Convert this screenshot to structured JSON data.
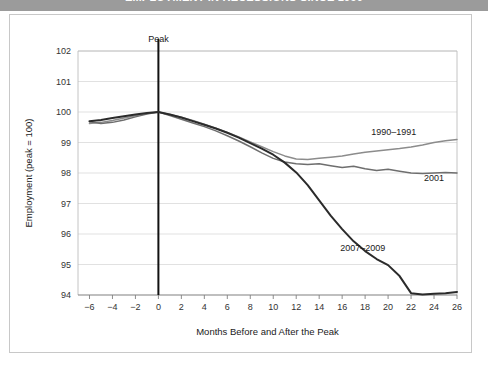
{
  "title": "EMPLOYMENT IN RECESSIONS SINCE 1990",
  "chart_data": {
    "type": "line",
    "title": "EMPLOYMENT IN RECESSIONS SINCE 1990",
    "xlabel": "Months Before and After the Peak",
    "ylabel": "Employment (peak = 100)",
    "xlim": [
      -7,
      26
    ],
    "ylim": [
      94,
      102
    ],
    "xticks": [
      -6,
      -4,
      -2,
      0,
      2,
      4,
      6,
      8,
      10,
      12,
      14,
      16,
      18,
      20,
      22,
      24,
      26
    ],
    "xtick_labels": [
      "−6",
      "−4",
      "−2",
      "0",
      "2",
      "4",
      "6",
      "8",
      "10",
      "12",
      "14",
      "16",
      "18",
      "20",
      "22",
      "24",
      "26"
    ],
    "yticks": [
      94,
      95,
      96,
      97,
      98,
      99,
      100,
      101,
      102
    ],
    "ytick_labels": [
      "94",
      "95",
      "96",
      "97",
      "98",
      "99",
      "100",
      "101",
      "102"
    ],
    "grid": "horizontal",
    "legend": "inline-annotations",
    "annotations": [
      {
        "text": "Peak",
        "x": 0,
        "y": 102.3,
        "kind": "vertical-line-label"
      },
      {
        "text": "1990–1991",
        "x": 20.5,
        "y": 99.25,
        "kind": "series-label"
      },
      {
        "text": "2001",
        "x": 24.0,
        "y": 97.75,
        "kind": "series-label"
      },
      {
        "text": "2007–2009",
        "x": 17.8,
        "y": 95.45,
        "kind": "series-label"
      }
    ],
    "series": [
      {
        "name": "1990–1991",
        "color": "#8c8c8c",
        "x": [
          -6,
          -5,
          -4,
          -3,
          -2,
          -1,
          0,
          1,
          2,
          3,
          4,
          5,
          6,
          7,
          8,
          9,
          10,
          11,
          12,
          13,
          14,
          15,
          16,
          17,
          18,
          19,
          20,
          21,
          22,
          23,
          24,
          25,
          26
        ],
        "values": [
          99.62,
          99.66,
          99.72,
          99.8,
          99.88,
          99.95,
          100.0,
          99.92,
          99.83,
          99.72,
          99.6,
          99.47,
          99.33,
          99.18,
          99.02,
          98.86,
          98.7,
          98.56,
          98.46,
          98.44,
          98.48,
          98.52,
          98.56,
          98.62,
          98.68,
          98.72,
          98.76,
          98.8,
          98.85,
          98.92,
          99.0,
          99.06,
          99.1
        ]
      },
      {
        "name": "2001",
        "color": "#6e6e6e",
        "x": [
          -6,
          -5,
          -4,
          -3,
          -2,
          -1,
          0,
          1,
          2,
          3,
          4,
          5,
          6,
          7,
          8,
          9,
          10,
          11,
          12,
          13,
          14,
          15,
          16,
          17,
          18,
          19,
          20,
          21,
          22,
          23,
          24,
          25,
          26
        ],
        "values": [
          99.68,
          99.62,
          99.66,
          99.74,
          99.84,
          99.93,
          100.0,
          99.88,
          99.76,
          99.64,
          99.52,
          99.38,
          99.22,
          99.05,
          98.86,
          98.66,
          98.48,
          98.36,
          98.3,
          98.28,
          98.3,
          98.24,
          98.18,
          98.22,
          98.14,
          98.08,
          98.12,
          98.06,
          98.0,
          97.98,
          98.0,
          98.02,
          98.0
        ]
      },
      {
        "name": "2007–2009",
        "color": "#2b2b2b",
        "x": [
          -6,
          -5,
          -4,
          -3,
          -2,
          -1,
          0,
          1,
          2,
          3,
          4,
          5,
          6,
          7,
          8,
          9,
          10,
          11,
          12,
          13,
          14,
          15,
          16,
          17,
          18,
          19,
          20,
          21,
          22,
          23,
          24,
          25,
          26
        ],
        "values": [
          99.7,
          99.74,
          99.8,
          99.86,
          99.92,
          99.97,
          100.0,
          99.92,
          99.82,
          99.7,
          99.58,
          99.46,
          99.32,
          99.16,
          98.98,
          98.8,
          98.6,
          98.34,
          98.02,
          97.6,
          97.1,
          96.6,
          96.16,
          95.76,
          95.44,
          95.18,
          94.98,
          94.62,
          94.06,
          94.02,
          94.04,
          94.06,
          94.1
        ]
      }
    ]
  }
}
